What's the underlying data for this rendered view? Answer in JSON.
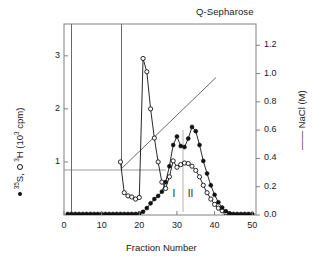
{
  "chart_data": {
    "type": "line",
    "title": "Q-Sepharose",
    "xlabel": "Fraction Number",
    "ylabel_left": "35S, 3H (10^3 cpm)",
    "ylabel_right": "NaCl (M)",
    "xlim": [
      0,
      51
    ],
    "ylim_left": [
      0,
      3.6
    ],
    "ylim_right": [
      0,
      1.35
    ],
    "xticks": [
      0,
      10,
      20,
      30,
      40,
      50
    ],
    "yticks_left": [
      1,
      2,
      3
    ],
    "yticks_right": [
      0.0,
      0.2,
      0.4,
      0.6,
      0.8,
      1.0,
      1.2
    ],
    "grid": false,
    "legend_position": "axis-labels",
    "annotations": [
      {
        "text": "I",
        "x": 29.2,
        "y": 0.38
      },
      {
        "text": "II",
        "x": 33.6,
        "y": 0.38
      }
    ],
    "divider_x": 31.6,
    "reference_line_y": 1.0,
    "reference_line_x_range": [
      0.8,
      26.5
    ],
    "offscale_spikes": [
      2.0,
      15.0
    ],
    "series": [
      {
        "name": "35S",
        "marker": "filled-circle",
        "color": "#111111",
        "axis": "left",
        "x": [
          1,
          2,
          3,
          4,
          5,
          6,
          7,
          8,
          9,
          10,
          11,
          12,
          13,
          14,
          15,
          16,
          17,
          18,
          19,
          20,
          21,
          22,
          23,
          24,
          25,
          26,
          27,
          28,
          29,
          30,
          31,
          32,
          33,
          34,
          35,
          36,
          37,
          38,
          39,
          40,
          41,
          42,
          43,
          44,
          45,
          46,
          47,
          48,
          49,
          50
        ],
        "y": [
          0.02,
          0.02,
          0.02,
          0.02,
          0.02,
          0.02,
          0.02,
          0.02,
          0.02,
          0.02,
          0.02,
          0.02,
          0.02,
          0.02,
          0.02,
          0.02,
          0.02,
          0.02,
          0.02,
          0.03,
          0.06,
          0.13,
          0.22,
          0.3,
          0.36,
          0.44,
          0.62,
          0.92,
          1.32,
          1.48,
          1.3,
          1.28,
          1.44,
          1.66,
          1.58,
          1.32,
          1.02,
          0.78,
          0.56,
          0.38,
          0.24,
          0.14,
          0.07,
          0.03,
          0.02,
          0.02,
          0.02,
          0.02,
          0.02,
          0.02
        ]
      },
      {
        "name": "3H",
        "marker": "open-circle",
        "color": "#111111",
        "axis": "left",
        "x": [
          15,
          16,
          17,
          18,
          19,
          20,
          21,
          22,
          23,
          24,
          25,
          26,
          27,
          28,
          29,
          30,
          31,
          32,
          33,
          34,
          35,
          36,
          37,
          38,
          39,
          40,
          41,
          42,
          43,
          44
        ],
        "y": [
          1.0,
          0.42,
          0.36,
          0.34,
          0.3,
          0.33,
          2.95,
          2.7,
          2.0,
          1.45,
          1.0,
          0.62,
          0.5,
          0.72,
          1.02,
          0.9,
          0.95,
          0.98,
          0.97,
          0.92,
          0.84,
          0.72,
          0.56,
          0.42,
          0.3,
          0.2,
          0.13,
          0.08,
          0.04,
          0.02
        ]
      },
      {
        "name": "NaCl gradient",
        "marker": "line",
        "color": "#555555",
        "axis": "right",
        "x": [
          15,
          40
        ],
        "y": [
          0.335,
          0.625
        ]
      }
    ]
  },
  "axes": {
    "title": "Q-Sepharose",
    "x_title": "Fraction Number",
    "y_left_prefix": "35",
    "y_left_mid": "H (10",
    "y_left_exp": "3",
    "y_left_suffix": " cpm)",
    "y_right_title": "NaCl (M)",
    "x_tick_labels": [
      "0",
      "10",
      "20",
      "30",
      "40",
      "50"
    ],
    "y_left_tick_labels": [
      "1",
      "2",
      "3"
    ],
    "y_right_tick_labels": [
      "0.0",
      "0.2",
      "0.4",
      "0.6",
      "0.8",
      "1.0",
      "1.2"
    ]
  },
  "peak_labels": {
    "first": "I",
    "second": "II"
  }
}
